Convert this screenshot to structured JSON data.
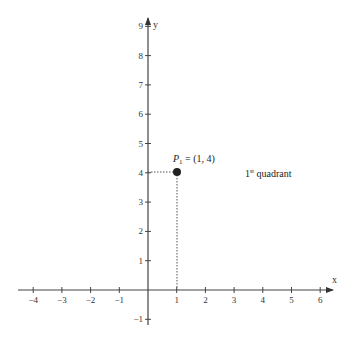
{
  "chart_data": {
    "type": "scatter",
    "title": "",
    "xlabel": "x",
    "ylabel": "y",
    "xlim": [
      -4.5,
      6.5
    ],
    "ylim": [
      -1.2,
      9.2
    ],
    "grid": false,
    "x_ticks": [
      -4,
      -3,
      -2,
      -1,
      1,
      2,
      3,
      4,
      5,
      6
    ],
    "y_ticks": [
      -1,
      1,
      2,
      3,
      4,
      5,
      6,
      7,
      8,
      9
    ],
    "points": [
      {
        "name": "P1",
        "x": 1,
        "y": 4,
        "label": "P₁ = (1, 4)"
      }
    ],
    "annotations": [
      {
        "text": "1st quadrant",
        "x": 3.4,
        "y": 4
      }
    ],
    "guides": "dotted lines from point to both axes"
  },
  "labels": {
    "x_axis": "x",
    "y_axis": "y",
    "point_name": "P",
    "point_sub": "1",
    "point_coords": " = (1, 4)",
    "quadrant_num": "1",
    "quadrant_sup": "st",
    "quadrant_text": " quadrant"
  }
}
